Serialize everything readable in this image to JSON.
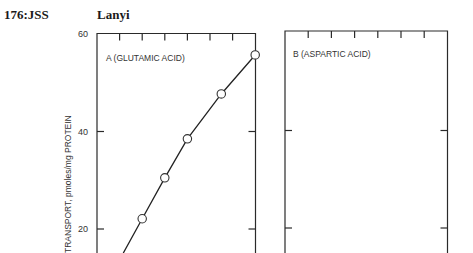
{
  "header": {
    "page_ref": "176:JSS",
    "author": "Lanyi"
  },
  "chart_data": [
    {
      "type": "line",
      "title": "A (GLUTAMIC ACID)",
      "ylabel": "TRANSPORT, pmoles/mg PROTEIN",
      "xlabel": "",
      "yticks": [
        20,
        40,
        60
      ],
      "ylim": [
        13,
        60
      ],
      "x_tick_count": 6,
      "series": [
        {
          "name": "Glutamic acid",
          "marker": "open-circle",
          "x": [
            2,
            3,
            4,
            5.5,
            7
          ],
          "y": [
            22.1,
            30.5,
            38.5,
            47.7,
            55.7
          ]
        }
      ]
    },
    {
      "type": "line",
      "title": "B (ASPARTIC ACID)",
      "ylabel": "",
      "xlabel": "",
      "yticks": [
        20,
        40,
        60
      ],
      "ylim": [
        13,
        60
      ],
      "x_tick_count": 6,
      "series": []
    }
  ],
  "colors": {
    "ink": "#222222",
    "axis": "#333333",
    "background": "#ffffff"
  }
}
